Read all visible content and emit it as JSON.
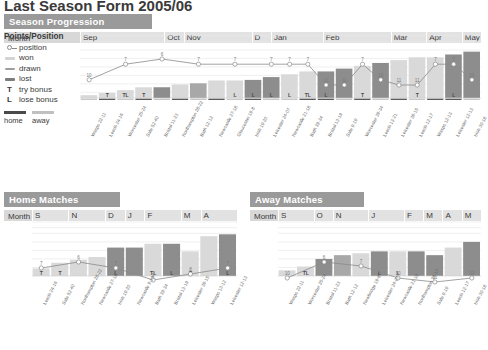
{
  "page_title": "Last Season Form 2005/06",
  "legend": {
    "title": "Points/Position",
    "items": [
      {
        "key": "position-marker",
        "label": "position"
      },
      {
        "key": "won-swatch",
        "label": "won",
        "color": "#d4d4d4"
      },
      {
        "key": "drawn-swatch",
        "label": "drawn",
        "color": "#9e9e9e"
      },
      {
        "key": "lost-swatch",
        "label": "lost",
        "color": "#7d7d7d"
      },
      {
        "key": "try-bonus-letter",
        "label": "try bonus",
        "glyph": "T"
      },
      {
        "key": "lose-bonus-letter",
        "label": "lose bonus",
        "glyph": "L"
      }
    ],
    "home_label": "home",
    "away_label": "away",
    "home_color": "#4a4a4a",
    "away_color": "#c0c0c0"
  },
  "season": {
    "title": "Season Progression",
    "month_header_label": "Month",
    "months": [
      {
        "label": "Sep",
        "span": 5
      },
      {
        "label": "Oct",
        "span": 1
      },
      {
        "label": "Nov",
        "span": 4
      },
      {
        "label": "D",
        "span": 1
      },
      {
        "label": "Jan",
        "span": 3
      },
      {
        "label": "Feb",
        "span": 4
      },
      {
        "label": "Mar",
        "span": 2
      },
      {
        "label": "Apr",
        "span": 2
      },
      {
        "label": "May",
        "span": 1
      }
    ]
  },
  "home": {
    "title": "Home Matches",
    "month_header_label": "Month",
    "months": [
      {
        "label": "S",
        "span": 2
      },
      {
        "label": "N",
        "span": 2
      },
      {
        "label": "D",
        "span": 1
      },
      {
        "label": "J",
        "span": 1
      },
      {
        "label": "F",
        "span": 2
      },
      {
        "label": "M",
        "span": 1
      },
      {
        "label": "A",
        "span": 2
      }
    ]
  },
  "away": {
    "title": "Away Matches",
    "month_header_label": "Month",
    "months": [
      {
        "label": "S",
        "span": 2
      },
      {
        "label": "O",
        "span": 1
      },
      {
        "label": "N",
        "span": 2
      },
      {
        "label": "J",
        "span": 2
      },
      {
        "label": "F",
        "span": 1
      },
      {
        "label": "M",
        "span": 1
      },
      {
        "label": "A",
        "span": 1
      },
      {
        "label": "M",
        "span": 1
      }
    ]
  },
  "chart_data": [
    {
      "id": "season-progression",
      "type": "line",
      "title": "Season Progression",
      "xlabel": "",
      "ylabel": "Points/Position",
      "ylim": [
        0,
        115
      ],
      "yticks": [
        10,
        25,
        40,
        55,
        70,
        85,
        100,
        110
      ],
      "grid": true,
      "legend_position": "left",
      "categories": [
        "Wasps 22-11",
        "Leeds 24-16",
        "Worcester 25-24",
        "Sale 52-40",
        "Bristol 11-23",
        "Northampton 28-22",
        "Bath 12-12",
        "Newcastle 27-18",
        "Gloucester 19-8",
        "Irish 19-20",
        "Leicester 24-07",
        "Newcastle 21-18",
        "Bath 39-34",
        "Bristol 13-19",
        "Sale 9-19",
        "Worcester 39-34",
        "Leeds 13-21",
        "Leicester 39-15",
        "Leeds 12-17",
        "Wasps 12-13",
        "Leicester 12-13",
        "Irish 30-18"
      ],
      "series": [
        {
          "name": "position",
          "values": [
            10,
            7,
            6,
            7,
            7,
            7,
            7,
            7,
            11,
            11,
            7,
            10,
            11,
            11,
            7,
            7,
            10
          ],
          "labels": [
            "10",
            "7",
            "6",
            "7",
            "7",
            "7",
            "7",
            "7",
            "11",
            "11",
            "7",
            "10",
            "11",
            "11",
            "7",
            "7",
            "10"
          ]
        },
        {
          "name": "points",
          "values": [
            5,
            9,
            14,
            19,
            19,
            24,
            26,
            31,
            31,
            32,
            37,
            42,
            47,
            47,
            52,
            57,
            62,
            67,
            72,
            72,
            77,
            82
          ]
        }
      ],
      "bar_results": [
        {
          "match": "Wasps 22-11",
          "result": "won",
          "bonus": "",
          "venue": "away"
        },
        {
          "match": "Leeds 24-16",
          "result": "won",
          "bonus": "T",
          "venue": "home"
        },
        {
          "match": "Worcester 25-24",
          "result": "won",
          "bonus": "TL",
          "venue": "away"
        },
        {
          "match": "Sale 52-40",
          "result": "won",
          "bonus": "T",
          "venue": "home"
        },
        {
          "match": "Bristol 11-23",
          "result": "lost",
          "bonus": "",
          "venue": "away"
        },
        {
          "match": "Northampton 28-22",
          "result": "won",
          "bonus": "",
          "venue": "home"
        },
        {
          "match": "Bath 12-12",
          "result": "drawn",
          "bonus": "",
          "venue": "away"
        },
        {
          "match": "Newcastle 27-18",
          "result": "won",
          "bonus": "",
          "venue": "home"
        },
        {
          "match": "Gloucester 19-8",
          "result": "won",
          "bonus": "L",
          "venue": "away"
        },
        {
          "match": "Irish 19-20",
          "result": "lost",
          "bonus": "L",
          "venue": "home"
        },
        {
          "match": "Leicester 24-07",
          "result": "lost",
          "bonus": "L",
          "venue": "away"
        },
        {
          "match": "Newcastle 21-18",
          "result": "won",
          "bonus": "L",
          "venue": "away"
        },
        {
          "match": "Bath 39-34",
          "result": "won",
          "bonus": "TL",
          "venue": "home"
        },
        {
          "match": "Bristol 13-19",
          "result": "lost",
          "bonus": "L",
          "venue": "home"
        },
        {
          "match": "Sale 9-19",
          "result": "lost",
          "bonus": "",
          "venue": "away"
        },
        {
          "match": "Worcester 39-34",
          "result": "won",
          "bonus": "T",
          "venue": "home"
        },
        {
          "match": "Leeds 13-21",
          "result": "lost",
          "bonus": "",
          "venue": "away"
        },
        {
          "match": "Leicester 39-15",
          "result": "won",
          "bonus": "",
          "venue": "home"
        },
        {
          "match": "Leeds 12-17",
          "result": "won",
          "bonus": "T",
          "venue": "away"
        },
        {
          "match": "Wasps 12-13",
          "result": "won",
          "bonus": "",
          "venue": "home"
        },
        {
          "match": "Leicester 12-13",
          "result": "lost",
          "bonus": "L",
          "venue": "home"
        },
        {
          "match": "Irish 30-18",
          "result": "lost",
          "bonus": "",
          "venue": "away"
        }
      ]
    },
    {
      "id": "home-matches",
      "type": "line",
      "title": "Home Matches",
      "xlabel": "",
      "ylabel": "",
      "ylim": [
        0,
        57
      ],
      "yticks": [
        9,
        18,
        27,
        36,
        45,
        51,
        57
      ],
      "grid": true,
      "categories": [
        "Leeds 24-16",
        "Sale 52-40",
        "Northampton 28-22",
        "Newcastle 27-18",
        "Irish 19-20",
        "Newcastle 9-19",
        "Bath 39-34",
        "Bristol 13-19",
        "Leicester 39-15",
        "Wasps 13-12",
        "Leicester 12-13"
      ],
      "series": [
        {
          "name": "position",
          "values": [
            7,
            6,
            7,
            9,
            8,
            7
          ],
          "labels": [
            "7",
            "6",
            "7",
            "9",
            "8",
            "7"
          ]
        }
      ],
      "bar_results": [
        {
          "match": "Leeds 24-16",
          "result": "won",
          "bonus": "T"
        },
        {
          "match": "Sale 52-40",
          "result": "won",
          "bonus": "T"
        },
        {
          "match": "Northampton 28-22",
          "result": "won",
          "bonus": ""
        },
        {
          "match": "Newcastle 27-18",
          "result": "won",
          "bonus": ""
        },
        {
          "match": "Irish 19-20",
          "result": "lost",
          "bonus": "L"
        },
        {
          "match": "Newcastle 9-19",
          "result": "lost",
          "bonus": ""
        },
        {
          "match": "Bath 39-34",
          "result": "won",
          "bonus": "TL"
        },
        {
          "match": "Bristol 13-19",
          "result": "lost",
          "bonus": "L"
        },
        {
          "match": "Leicester 39-15",
          "result": "won",
          "bonus": "T"
        },
        {
          "match": "Wasps 13-12",
          "result": "won",
          "bonus": ""
        },
        {
          "match": "Leicester 12-13",
          "result": "lost",
          "bonus": "L"
        }
      ]
    },
    {
      "id": "away-matches",
      "type": "line",
      "title": "Away Matches",
      "xlabel": "",
      "ylabel": "",
      "ylim": [
        0,
        57
      ],
      "yticks": [
        9,
        18,
        27,
        36,
        45,
        51,
        57
      ],
      "grid": true,
      "categories": [
        "Wasps 22-11",
        "Worcester 25-24",
        "Bristol 11-23",
        "Bath 12-12",
        "Newbridge 19-8",
        "Leicester 24-07",
        "Newcastle 21-18",
        "Northampton 39-17",
        "Sale 9-19",
        "Leeds 12-17",
        "Irish 30-18"
      ],
      "series": [
        {
          "name": "position",
          "values": [
            10,
            6,
            7,
            10,
            11,
            10
          ],
          "labels": [
            "10",
            "6",
            "7",
            "10",
            "11",
            "10"
          ]
        }
      ],
      "bar_results": [
        {
          "match": "Wasps 22-11",
          "result": "won",
          "bonus": ""
        },
        {
          "match": "Worcester 25-24",
          "result": "won",
          "bonus": "TL"
        },
        {
          "match": "Bristol 11-23",
          "result": "lost",
          "bonus": ""
        },
        {
          "match": "Bath 12-12",
          "result": "drawn",
          "bonus": ""
        },
        {
          "match": "Newbridge 19-8",
          "result": "won",
          "bonus": ""
        },
        {
          "match": "Leicester 24-07",
          "result": "lost",
          "bonus": "L"
        },
        {
          "match": "Newcastle 21-18",
          "result": "won",
          "bonus": "L"
        },
        {
          "match": "Northampton 39-17",
          "result": "lost",
          "bonus": ""
        },
        {
          "match": "Sale 9-19",
          "result": "lost",
          "bonus": ""
        },
        {
          "match": "Leeds 12-17",
          "result": "won",
          "bonus": ""
        },
        {
          "match": "Irish 30-18",
          "result": "lost",
          "bonus": ""
        }
      ]
    }
  ]
}
